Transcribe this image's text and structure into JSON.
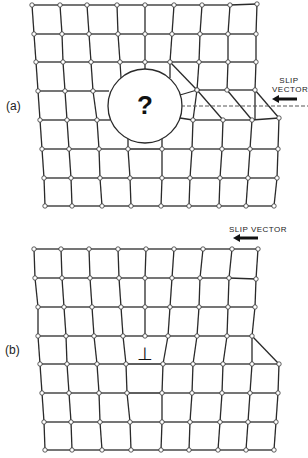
{
  "figure": {
    "panels": [
      {
        "id": "a",
        "label": "(a)",
        "label_pos": [
          6,
          99
        ],
        "slip_label": "SLIP\nVECTOR",
        "slip_label_lines": [
          "SLIP",
          "VECTOR"
        ],
        "slip_label_pos": [
          275,
          77
        ],
        "slip_arrow": {
          "x1": 297,
          "x2": 272,
          "y": 99
        },
        "dashed_line": {
          "x1": 181,
          "x2": 308,
          "y": 106
        },
        "circle": {
          "cx": 145,
          "cy": 106,
          "r": 37
        },
        "center_symbol": "?",
        "rows": [
          [
            [
              32,
              5
            ],
            [
              60,
              5
            ],
            [
              87,
              5
            ],
            [
              117,
              5
            ],
            [
              145,
              5
            ],
            [
              174,
              5
            ],
            [
              202,
              5
            ],
            [
              230,
              5
            ],
            [
              257,
              4
            ]
          ],
          [
            [
              34,
              34
            ],
            [
              62,
              34
            ],
            [
              89,
              34
            ],
            [
              118,
              34
            ],
            [
              145,
              34
            ],
            [
              172,
              34
            ],
            [
              200,
              34
            ],
            [
              228,
              34
            ],
            [
              256,
              34
            ]
          ],
          [
            [
              36,
              62
            ],
            [
              63,
              62
            ],
            [
              91,
              62
            ],
            [
              120,
              62
            ],
            [
              145,
              62
            ],
            [
              170,
              62
            ],
            [
              199,
              62
            ],
            [
              228,
              62
            ],
            [
              256,
              62
            ]
          ],
          [
            [
              38,
              91
            ],
            [
              65,
              91
            ],
            [
              93,
              91
            ],
            [
              null,
              null
            ],
            [
              null,
              null
            ],
            [
              197,
              90
            ],
            [
              197,
              90
            ],
            [
              227,
              90
            ],
            [
              255,
              90
            ]
          ],
          [
            [
              40,
              120
            ],
            [
              67,
              120
            ],
            [
              97,
              120
            ],
            [
              null,
              null
            ],
            [
              null,
              null
            ],
            [
              193,
              120
            ],
            [
              223,
              120
            ],
            [
              252,
              120
            ],
            [
              279,
              118
            ]
          ],
          [
            [
              42,
              149
            ],
            [
              69,
              149
            ],
            [
              99,
              149
            ],
            [
              128,
              149
            ],
            [
              162,
              149
            ],
            [
              192,
              149
            ],
            [
              222,
              149
            ],
            [
              250,
              149
            ],
            [
              278,
              149
            ]
          ],
          [
            [
              44,
              178
            ],
            [
              71,
              178
            ],
            [
              100,
              178
            ],
            [
              130,
              178
            ],
            [
              162,
              178
            ],
            [
              190,
              178
            ],
            [
              220,
              178
            ],
            [
              248,
              178
            ],
            [
              277,
              178
            ]
          ],
          [
            [
              45,
              206
            ],
            [
              72,
              206
            ],
            [
              102,
              206
            ],
            [
              131,
              206
            ],
            [
              161,
              206
            ],
            [
              189,
              206
            ],
            [
              219,
              206
            ],
            [
              246,
              206
            ],
            [
              274,
              206
            ]
          ]
        ]
      },
      {
        "id": "b",
        "label": "(b)",
        "label_pos": [
          5,
          343
        ],
        "slip_label": "SLIP VECTOR",
        "slip_label_pos": [
          228,
          226
        ],
        "slip_arrow": {
          "x1": 258,
          "x2": 233,
          "y": 238
        },
        "dislocation_symbol": "⊥",
        "dislocation_pos": [
          145,
          355
        ],
        "rows": [
          [
            [
              34,
              249
            ],
            [
              61,
              249
            ],
            [
              89,
              249
            ],
            [
              118,
              249
            ],
            [
              146,
              249
            ],
            [
              174,
              249
            ],
            [
              203,
              249
            ],
            [
              232,
              249
            ],
            [
              258,
              249
            ]
          ],
          [
            [
              35,
              278
            ],
            [
              62,
              278
            ],
            [
              90,
              278
            ],
            [
              119,
              278
            ],
            [
              145,
              278
            ],
            [
              172,
              278
            ],
            [
              200,
              278
            ],
            [
              229,
              278
            ],
            [
              256,
              279
            ]
          ],
          [
            [
              38,
              307
            ],
            [
              64,
              307
            ],
            [
              92,
              307
            ],
            [
              121,
              307
            ],
            [
              145,
              307
            ],
            [
              170,
              307
            ],
            [
              199,
              307
            ],
            [
              228,
              307
            ],
            [
              255,
              307
            ]
          ],
          [
            [
              38,
              336
            ],
            [
              66,
              336
            ],
            [
              94,
              336
            ],
            [
              123,
              336
            ],
            [
              145,
              336
            ],
            [
              168,
              336
            ],
            [
              197,
              336
            ],
            [
              227,
              336
            ],
            [
              252,
              336
            ]
          ],
          [
            [
              40,
              364
            ],
            [
              67,
              364
            ],
            [
              97,
              364
            ],
            [
              126,
              364
            ],
            [
              null,
              null
            ],
            [
              163,
              364
            ],
            [
              193,
              364
            ],
            [
              223,
              364
            ],
            [
              252,
              364
            ],
            [
              279,
              364
            ]
          ],
          [
            [
              42,
              393
            ],
            [
              69,
              393
            ],
            [
              99,
              393
            ],
            [
              127,
              393
            ],
            [
              162,
              393
            ],
            [
              192,
              393
            ],
            [
              222,
              393
            ],
            [
              250,
              393
            ],
            [
              278,
              393
            ]
          ],
          [
            [
              44,
              422
            ],
            [
              71,
              422
            ],
            [
              100,
              422
            ],
            [
              130,
              422
            ],
            [
              162,
              422
            ],
            [
              190,
              422
            ],
            [
              220,
              422
            ],
            [
              248,
              422
            ],
            [
              276,
              422
            ]
          ],
          [
            [
              45,
              450
            ],
            [
              72,
              450
            ],
            [
              102,
              450
            ],
            [
              131,
              450
            ],
            [
              161,
              450
            ],
            [
              189,
              450
            ],
            [
              218,
              450
            ],
            [
              246,
              450
            ],
            [
              274,
              450
            ]
          ]
        ]
      }
    ],
    "style": {
      "line_color": "#2a2a2a",
      "node_fill": "#ffffff",
      "node_stroke": "#333333",
      "node_radius": 2.2
    }
  }
}
